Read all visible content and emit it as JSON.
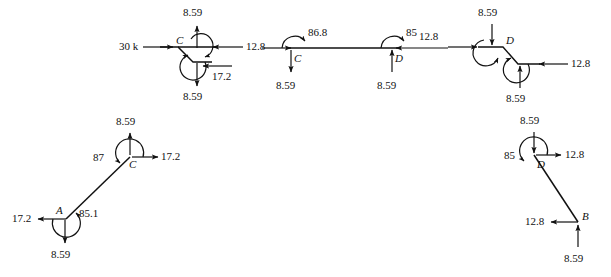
{
  "figure": {
    "kind": "free-body-diagrams",
    "member_color": "#111111",
    "text_color": "#111111",
    "diagrams": [
      {
        "id": "fbd-joint-c-top-left",
        "name": "joint-c-stepped-top-left",
        "joint_label": "C",
        "labels": {
          "left_force": "30 k",
          "right_force": "12.8",
          "top_force": "8.59",
          "bottom_force": "8.59",
          "inner_force": "17.2"
        }
      },
      {
        "id": "fbd-beam-cd-middle",
        "name": "beam-c-to-d-middle",
        "joint_label_left": "C",
        "joint_label_right": "D",
        "labels": {
          "left_force": "12.8",
          "left_moment": "86.8",
          "left_down_force": "8.59",
          "right_moment": "85",
          "right_up_force": "8.59",
          "right_force": "12.8"
        }
      },
      {
        "id": "fbd-joint-d-top-right",
        "name": "joint-d-stepped-top-right",
        "joint_label": "D",
        "labels": {
          "left_force": "12.8",
          "top_force": "8.59",
          "right_force": "12.8",
          "bottom_force": "8.59"
        }
      },
      {
        "id": "fbd-member-ac-lower-left",
        "name": "member-a-to-c-lower-left",
        "joint_label_top": "C",
        "joint_label_bottom": "A",
        "labels": {
          "top_up_force": "8.59",
          "top_moment": "87",
          "top_right_force": "17.2",
          "bottom_left_force": "17.2",
          "bottom_moment": "85.1",
          "bottom_down_force": "8.59"
        }
      },
      {
        "id": "fbd-member-db-lower-right",
        "name": "member-d-to-b-lower-right",
        "joint_label_top": "D",
        "joint_label_bottom": "B",
        "labels": {
          "top_down_force": "8.59",
          "top_moment": "85",
          "top_right_force": "12.8",
          "bottom_left_force": "12.8",
          "bottom_up_force": "8.59"
        }
      }
    ]
  }
}
